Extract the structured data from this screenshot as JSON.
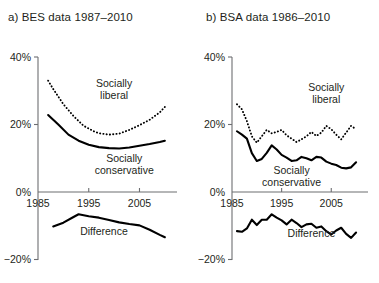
{
  "figure": {
    "background": "#ffffff",
    "ink": "#231f20",
    "axis_color": "#6d6e71",
    "series_color": "#000000"
  },
  "chart_data": [
    {
      "type": "line",
      "panel": "a",
      "title": "a) BES data 1987–2010",
      "xlabel": "",
      "ylabel": "",
      "xlim": [
        1985,
        2012
      ],
      "ylim": [
        -20,
        40
      ],
      "xticks": [
        1985,
        1995,
        2005
      ],
      "xticklabels": [
        "1985",
        "1995",
        "2005"
      ],
      "yticks": [
        -20,
        0,
        20,
        40
      ],
      "yticklabels": [
        "−20%",
        "0%",
        "20%",
        "40%"
      ],
      "grid": false,
      "legend": "inline-annotations",
      "series": [
        {
          "name": "Socially liberal",
          "style": "dotted",
          "label": "Socially liberal",
          "label_x": 2000,
          "label_y": 31,
          "x": [
            1987,
            1988,
            1990,
            1992,
            1994,
            1996,
            1997,
            1999,
            2001,
            2003,
            2005,
            2007,
            2009,
            2010
          ],
          "y": [
            33.0,
            30.5,
            26.0,
            22.5,
            19.6,
            18.0,
            17.4,
            17.0,
            17.3,
            18.4,
            19.8,
            21.4,
            23.6,
            25.2
          ]
        },
        {
          "name": "Socially conservative",
          "style": "solid",
          "label": "Socially conservative",
          "label_x": 2002,
          "label_y": 9,
          "x": [
            1987,
            1989,
            1991,
            1993,
            1995,
            1997,
            1999,
            2001,
            2003,
            2005,
            2007,
            2009,
            2010
          ],
          "y": [
            22.8,
            20.0,
            17.0,
            15.2,
            14.0,
            13.3,
            13.0,
            12.9,
            13.2,
            13.7,
            14.2,
            14.8,
            15.2
          ]
        },
        {
          "name": "Difference",
          "style": "solid",
          "label": "Difference",
          "label_x": 1998,
          "label_y": -12.6,
          "x": [
            1988,
            1990,
            1992,
            1993,
            1995,
            1997,
            1999,
            2001,
            2003,
            2005,
            2007,
            2009,
            2010
          ],
          "y": [
            -10.2,
            -9.1,
            -7.4,
            -6.6,
            -7.2,
            -7.6,
            -8.3,
            -9.0,
            -9.5,
            -9.9,
            -11.2,
            -12.7,
            -13.4
          ]
        }
      ]
    },
    {
      "type": "line",
      "panel": "b",
      "title": "b) BSA data 1986–2010",
      "xlabel": "",
      "ylabel": "",
      "xlim": [
        1985,
        2012
      ],
      "ylim": [
        -20,
        40
      ],
      "xticks": [
        1985,
        1995,
        2005
      ],
      "xticklabels": [
        "1985",
        "1995",
        "2005"
      ],
      "yticks": [
        -20,
        0,
        20,
        40
      ],
      "yticklabels": [
        "−20%",
        "0%",
        "20%",
        "40%"
      ],
      "grid": false,
      "legend": "inline-annotations",
      "series": [
        {
          "name": "Socially liberal",
          "style": "dotted",
          "label": "Socially liberal",
          "label_x": 2004,
          "label_y": 30,
          "x": [
            1986,
            1987,
            1988,
            1989,
            1990,
            1991,
            1992,
            1993,
            1994,
            1995,
            1996,
            1997,
            1998,
            1999,
            2000,
            2001,
            2002,
            2003,
            2004,
            2005,
            2006,
            2007,
            2008,
            2009,
            2010
          ],
          "y": [
            26.0,
            24.5,
            21.0,
            16.5,
            14.6,
            16.5,
            18.4,
            17.4,
            17.8,
            18.4,
            16.8,
            15.8,
            14.8,
            15.6,
            16.5,
            17.8,
            16.6,
            17.6,
            19.6,
            18.6,
            17.0,
            15.6,
            17.6,
            19.6,
            18.6
          ]
        },
        {
          "name": "Socially conservative",
          "style": "solid",
          "label": "Socially conservative",
          "label_x": 1997,
          "label_y": 5.4,
          "x": [
            1986,
            1987,
            1988,
            1989,
            1990,
            1991,
            1992,
            1993,
            1994,
            1995,
            1996,
            1997,
            1998,
            1999,
            2000,
            2001,
            2002,
            2003,
            2004,
            2005,
            2006,
            2007,
            2008,
            2009,
            2010
          ],
          "y": [
            18.0,
            17.0,
            15.8,
            11.5,
            9.2,
            9.8,
            11.6,
            13.8,
            12.6,
            11.0,
            10.2,
            9.2,
            9.4,
            10.4,
            10.0,
            9.4,
            10.4,
            10.2,
            9.0,
            8.4,
            8.0,
            7.2,
            7.0,
            7.3,
            8.8
          ]
        },
        {
          "name": "Difference",
          "style": "solid",
          "label": "Difference",
          "label_x": 2001,
          "label_y": -13.2,
          "x": [
            1986,
            1987,
            1988,
            1989,
            1990,
            1991,
            1992,
            1993,
            1994,
            1995,
            1996,
            1997,
            1998,
            1999,
            2000,
            2001,
            2002,
            2003,
            2004,
            2005,
            2006,
            2007,
            2008,
            2009,
            2010
          ],
          "y": [
            -11.6,
            -11.8,
            -10.8,
            -8.2,
            -9.8,
            -8.2,
            -8.2,
            -6.6,
            -7.6,
            -8.4,
            -9.6,
            -8.2,
            -9.2,
            -10.4,
            -9.6,
            -9.4,
            -10.6,
            -10.2,
            -11.6,
            -12.6,
            -11.4,
            -10.6,
            -12.4,
            -13.6,
            -12.0
          ]
        }
      ]
    }
  ]
}
